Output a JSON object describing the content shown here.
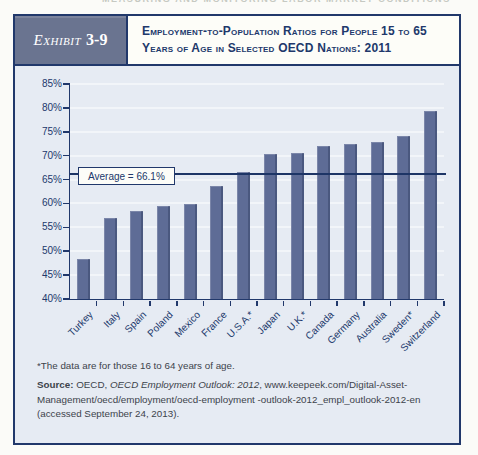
{
  "page_header": "MEASURING AND MONITORING LABOR MARKET CONDITIONS",
  "exhibit": {
    "label": "Exhibit",
    "number": "3-9",
    "title": "Employment-to-Population Ratios for People 15 to 65 Years of Age in Selected OECD Nations: 2011"
  },
  "chart_data": {
    "type": "bar",
    "title": "Employment-to-Population Ratios for People 15 to 65 Years of Age in Selected OECD Nations: 2011",
    "categories": [
      "Turkey",
      "Italy",
      "Spain",
      "Poland",
      "Mexico",
      "France",
      "U.S.A.*",
      "Japan",
      "U.K.*",
      "Canada",
      "Germany",
      "Australia",
      "Sweden*",
      "Switzerland"
    ],
    "values": [
      48.4,
      57.0,
      58.5,
      59.5,
      59.8,
      63.7,
      66.6,
      70.3,
      70.6,
      72.0,
      72.5,
      72.8,
      74.1,
      79.3
    ],
    "xlabel": "",
    "ylabel": "",
    "ylim": [
      40,
      85
    ],
    "yticks": [
      40,
      45,
      50,
      55,
      60,
      65,
      70,
      75,
      80,
      85
    ],
    "ytick_labels": [
      "40%",
      "45%",
      "50%",
      "55%",
      "60%",
      "65%",
      "70%",
      "75%",
      "80%",
      "85%"
    ],
    "grid": true,
    "legend": false,
    "average": 66.1,
    "average_label": "Average = 66.1%",
    "bar_color": "#5e6c96"
  },
  "footnotes": {
    "note": "*The data are for those 16 to 64 years of age.",
    "source_label": "Source:",
    "source_pre": " OECD, ",
    "source_italic": "OECD Employment Outlook: 2012",
    "source_rest": ", www.keepeek.com/Digital-Asset-Management/oecd/employment/oecd-employment -outlook-2012_empl_outlook-2012-en (accessed September 24, 2013)."
  },
  "colors": {
    "navy": "#21386b",
    "panel": "#e6ebf3",
    "tag_background": "#6a7490",
    "bar": "#5e6c96",
    "gridline": "#f2f5f9"
  }
}
